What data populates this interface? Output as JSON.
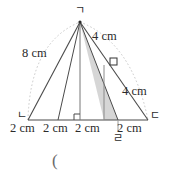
{
  "figure": {
    "type": "geometry-diagram",
    "shape": "triangle",
    "colors": {
      "stroke": "#444444",
      "shade_fill": "#d0d0d0",
      "guide_dotted": "#bdbdbd",
      "text": "#2b2b2b"
    },
    "vertices": [
      {
        "name": "apex",
        "label": "ㄱ",
        "x": 80,
        "y": 22
      },
      {
        "name": "base-left",
        "label": "ㄴ",
        "x": 28,
        "y": 120
      },
      {
        "name": "base-right",
        "label": "ㄷ",
        "x": 148,
        "y": 120
      },
      {
        "name": "base-point-4",
        "label": "ㄹ",
        "x": 118,
        "y": 120
      }
    ],
    "base_divisions": [
      {
        "x": 28
      },
      {
        "x": 58
      },
      {
        "x": 80
      },
      {
        "x": 118
      },
      {
        "x": 148
      }
    ],
    "segment_labels": [
      {
        "id": "seg-1",
        "text": "2 cm"
      },
      {
        "id": "seg-2",
        "text": "2 cm"
      },
      {
        "id": "seg-3",
        "text": "2 cm"
      },
      {
        "id": "seg-4",
        "text": "2 cm"
      }
    ],
    "side_labels": [
      {
        "id": "side-left",
        "text": "8 cm"
      },
      {
        "id": "side-top-right",
        "text": "4 cm"
      },
      {
        "id": "side-right",
        "text": "4 cm"
      }
    ],
    "right_angle_marks": [
      {
        "id": "right-angle-base",
        "x": 74,
        "y": 113
      },
      {
        "id": "right-angle-slant",
        "x": 112,
        "y": 62
      }
    ],
    "shaded_region": {
      "id": "shaded-triangle",
      "points": "80,22 118,120 104,120"
    },
    "caption": "("
  }
}
